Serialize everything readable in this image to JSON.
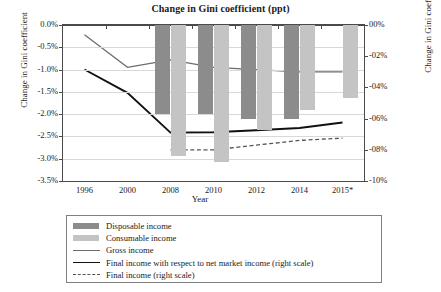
{
  "chart_data": {
    "type": "bar",
    "title": "Change in Gini coefficient (ppt)",
    "xlabel": "Year",
    "ylabel": "Change in Gini coefficient",
    "y2label": "Change in Gini coefficient: Final income",
    "categories": [
      "1996",
      "2000",
      "2008",
      "2010",
      "2012",
      "2014",
      "2015*"
    ],
    "ylim": [
      -3.5,
      0.0
    ],
    "y2lim": [
      -10,
      0
    ],
    "yticks": [
      "0.0%",
      "-0.5%",
      "-1.0%",
      "-1.5%",
      "-2.0%",
      "-2.5%",
      "-3.0%",
      "-3.5%"
    ],
    "ytick_values": [
      0.0,
      -0.5,
      -1.0,
      -1.5,
      -2.0,
      -2.5,
      -3.0,
      -3.5
    ],
    "y2ticks": [
      "00%",
      "-02%",
      "-04%",
      "-06%",
      "-08%",
      "-10%"
    ],
    "y2tick_values": [
      0,
      -2,
      -4,
      -6,
      -8,
      -10
    ],
    "grid": true,
    "legend_position": "below",
    "series": [
      {
        "name": "Disposable income",
        "type": "bar",
        "axis": "left",
        "color": "#8c8c8c",
        "values": [
          null,
          null,
          -2.0,
          -2.0,
          -2.1,
          -2.12,
          null
        ]
      },
      {
        "name": "Consumable income",
        "type": "bar",
        "axis": "left",
        "color": "#c4c4c4",
        "values": [
          null,
          null,
          -2.95,
          -3.08,
          -2.35,
          -1.9,
          -1.63
        ]
      },
      {
        "name": "Gross income",
        "type": "line",
        "axis": "left",
        "color": "#6b6b6b",
        "values": [
          -0.22,
          -0.95,
          -0.78,
          -0.95,
          -1.0,
          -1.05,
          -1.05
        ]
      },
      {
        "name": "Final income with respect to net market income (right scale)",
        "type": "line",
        "axis": "right",
        "color": "#111111",
        "values": [
          -2.85,
          -4.35,
          -6.9,
          -6.88,
          -6.75,
          -6.6,
          -6.25
        ]
      },
      {
        "name": "Final income (right scale)",
        "type": "line-dashed",
        "axis": "right",
        "color": "#555555",
        "values": [
          null,
          null,
          -8.0,
          -8.0,
          -7.7,
          -7.4,
          -7.25
        ]
      }
    ]
  },
  "title": "Change in Gini coefficient (ppt)",
  "axes": {
    "x_title": "Year",
    "y_left_title": "Change in Gini coefficient",
    "y_right_title": "Change in Gini coefficient: Final income"
  },
  "legend": {
    "items": [
      {
        "label": "Disposable income",
        "marker": "swatch-dark"
      },
      {
        "label": "Consumable income",
        "marker": "swatch-light"
      },
      {
        "label": "Gross income",
        "marker": "line-thin"
      },
      {
        "label": "Final income with respect to net market income (right scale)",
        "marker": "line-thick"
      },
      {
        "label": "Final income (right scale)",
        "marker": "line-dashed"
      }
    ]
  },
  "colors": {
    "disposable": "#8c8c8c",
    "consumable": "#c4c4c4",
    "gross": "#6b6b6b",
    "final_net_market": "#111111",
    "final": "#555555",
    "grid": "#d8d8d8",
    "axis": "#4a4a4a"
  }
}
